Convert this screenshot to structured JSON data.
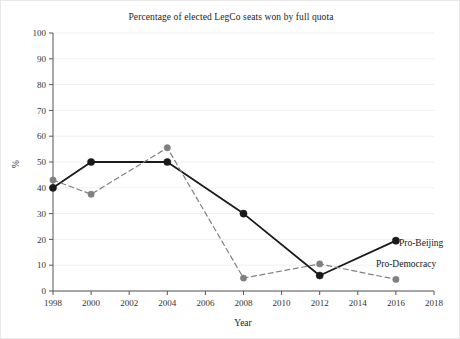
{
  "chart_data": {
    "type": "line",
    "title": "Percentage of elected LegCo seats won by full quota",
    "xlabel": "Year",
    "ylabel": "%",
    "x": [
      1998,
      2000,
      2004,
      2008,
      2012,
      2016
    ],
    "xlim": [
      1998,
      2018
    ],
    "ylim": [
      0,
      100
    ],
    "xticks": [
      1998,
      2000,
      2002,
      2004,
      2006,
      2008,
      2010,
      2012,
      2014,
      2016,
      2018
    ],
    "xticklabels": [
      "1998",
      "2000",
      "2002",
      "2004",
      "2006",
      "2008",
      "2010",
      "2012",
      "2014",
      "2016",
      "2018"
    ],
    "yticks": [
      0,
      10,
      20,
      30,
      40,
      50,
      60,
      70,
      80,
      90,
      100
    ],
    "yticklabels": [
      "0",
      "10",
      "20",
      "30",
      "40",
      "50",
      "60",
      "70",
      "80",
      "90",
      "100"
    ],
    "grid": "horizontal",
    "legend_position": "inline-right-of-last-point",
    "series": [
      {
        "name": "Pro-Beijing",
        "color": "#1a1a1a",
        "linestyle": "solid",
        "marker": "circle",
        "values": [
          40,
          50,
          50,
          30,
          6,
          19.5
        ]
      },
      {
        "name": "Pro-Democracy",
        "color": "#808080",
        "linestyle": "dashed",
        "marker": "circle",
        "values": [
          43,
          37.5,
          55.5,
          5,
          10.5,
          4.5
        ]
      }
    ]
  },
  "labels": {
    "pro_beijing": "Pro-Beijing",
    "pro_democracy": "Pro-Democracy"
  }
}
